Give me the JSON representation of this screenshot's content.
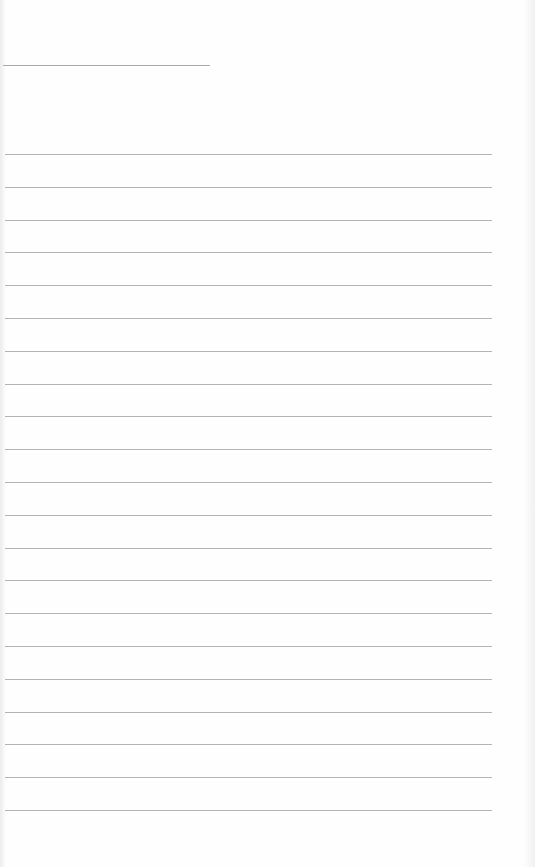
{
  "document": {
    "type": "blank lined page",
    "header_rule": {
      "y": 65,
      "x_start": 3,
      "x_end": 210
    },
    "ruled_lines": {
      "count": 21,
      "first_y": 154,
      "spacing": 32.8,
      "x_start": 5,
      "x_end": 492
    },
    "colors": {
      "paper": "#fefefe",
      "line": "#b4b4b4",
      "header_line": "#a9a9a9"
    }
  }
}
